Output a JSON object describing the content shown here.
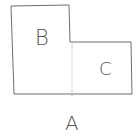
{
  "diagram": {
    "type": "composite-shape",
    "stroke_color": "#6e6e6e",
    "divider_color": "#b8b8b8",
    "labels": {
      "region_b": "B",
      "region_c": "C",
      "whole_shape": "A"
    }
  }
}
